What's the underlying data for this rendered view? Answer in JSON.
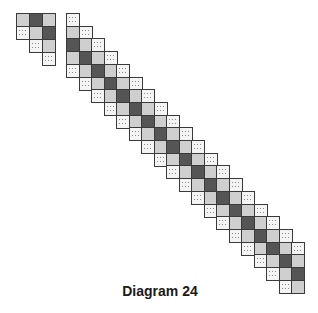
{
  "caption": "Diagram 24",
  "colors": {
    "light": "#cfcfcf",
    "dark": "#555555",
    "dotted": "#f4f4f4",
    "border": "#3a3a3a"
  },
  "cell_size": 12.6,
  "fragments": [
    {
      "name": "small-fragment",
      "origin": [
        16,
        13
      ],
      "step_x": 13,
      "step_y": 13,
      "rows": [
        [
          "light",
          "dark",
          "light"
        ],
        [
          "dotted",
          "light",
          "dark"
        ],
        [
          null,
          "dotted",
          "light"
        ],
        [
          null,
          null,
          "dotted"
        ]
      ]
    },
    {
      "name": "diagonal-band",
      "origin": [
        66,
        13
      ],
      "step_x": 12.5,
      "step_y": 12.7,
      "band_pattern": [
        "dotted",
        "light",
        "dark",
        "light",
        "dotted"
      ],
      "row_count": 22,
      "max_col": 18
    }
  ]
}
